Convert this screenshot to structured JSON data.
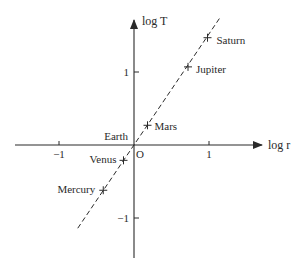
{
  "chart_data": {
    "type": "scatter",
    "title": "",
    "xlabel": "log r",
    "ylabel": "log T",
    "origin_label": "O",
    "xlim": [
      -1.6,
      1.75
    ],
    "ylim": [
      -1.55,
      1.75
    ],
    "x_ticks": [
      {
        "value": -1,
        "label": "−1"
      },
      {
        "value": 1,
        "label": "1"
      }
    ],
    "y_ticks": [
      {
        "value": 1,
        "label": "1"
      },
      {
        "value": -1,
        "label": "−1"
      }
    ],
    "grid": false,
    "legend": null,
    "series": [
      {
        "name": "Planets",
        "marker": "plus",
        "points": [
          {
            "label": "Mercury",
            "x": -0.41,
            "y": -0.62
          },
          {
            "label": "Venus",
            "x": -0.14,
            "y": -0.21
          },
          {
            "label": "Earth",
            "x": 0.0,
            "y": 0.0
          },
          {
            "label": "Mars",
            "x": 0.18,
            "y": 0.27
          },
          {
            "label": "Jupiter",
            "x": 0.72,
            "y": 1.07
          },
          {
            "label": "Saturn",
            "x": 0.98,
            "y": 1.47
          }
        ]
      },
      {
        "name": "Fit line",
        "style": "dashed",
        "slope": 1.5,
        "points": [
          {
            "x": -0.75,
            "y": -1.14
          },
          {
            "x": 1.15,
            "y": 1.75
          }
        ]
      }
    ]
  }
}
